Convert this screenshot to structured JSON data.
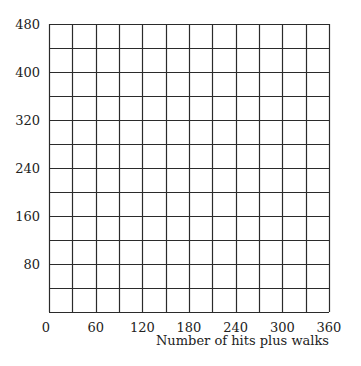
{
  "chart_data": {
    "type": "scatter",
    "title": "",
    "xlabel": "Number of hits plus walks",
    "ylabel": "",
    "xlim": [
      0,
      360
    ],
    "ylim": [
      0,
      480
    ],
    "x_ticks": [
      0,
      60,
      120,
      180,
      240,
      300,
      360
    ],
    "y_ticks": [
      80,
      160,
      240,
      320,
      400,
      480
    ],
    "x_grid_step": 30,
    "y_grid_step": 40,
    "grid": true,
    "legend": null,
    "series": []
  },
  "colors": {
    "grid": "#2b2b2b",
    "background": "#ffffff",
    "text": "#222222"
  }
}
